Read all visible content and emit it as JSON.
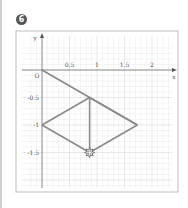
{
  "problem": {
    "number": "6"
  },
  "chart_data": {
    "type": "line",
    "title": "",
    "xlabel": "x",
    "ylabel": "y",
    "origin_label": "O",
    "xlim": [
      -0.1,
      2.1
    ],
    "ylim": [
      -1.8,
      0.3
    ],
    "grid": true,
    "x_ticks": [
      {
        "v": 0.5,
        "label": "0.5"
      },
      {
        "v": 1,
        "label": "1"
      },
      {
        "v": 1.5,
        "label": "1.5"
      },
      {
        "v": 2,
        "label": "2"
      }
    ],
    "y_ticks": [
      {
        "v": -0.5,
        "label": "-0.5"
      },
      {
        "v": -1,
        "label": "-1"
      },
      {
        "v": -1.5,
        "label": "-1.5"
      }
    ],
    "segments": [
      {
        "name": "ray-from-origin",
        "points": [
          [
            0,
            0
          ],
          [
            1.732,
            -1
          ]
        ]
      },
      {
        "name": "rhombus",
        "points": [
          [
            0,
            -1
          ],
          [
            0.866,
            -0.5
          ],
          [
            1.732,
            -1
          ],
          [
            0.866,
            -1.5
          ],
          [
            0,
            -1
          ]
        ]
      },
      {
        "name": "vertical-diagonal",
        "points": [
          [
            0.866,
            -0.5
          ],
          [
            0.866,
            -1.5
          ]
        ]
      }
    ],
    "marker": {
      "name": "star-marker",
      "point": [
        0.866,
        -1.5
      ]
    },
    "line_color": "#8a8a8a"
  }
}
